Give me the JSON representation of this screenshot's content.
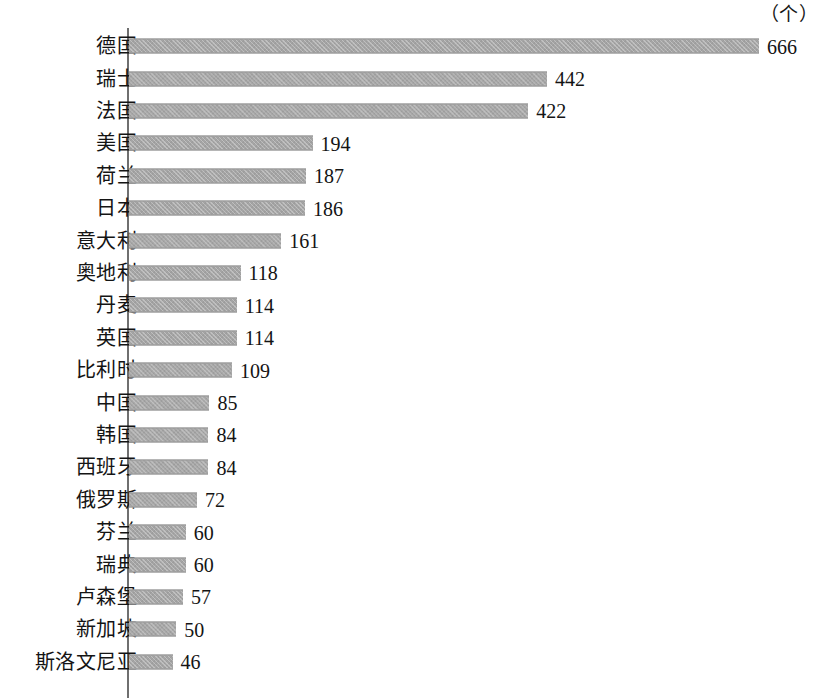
{
  "chart_data": {
    "type": "bar",
    "orientation": "horizontal",
    "title": "",
    "subtitle": "",
    "unit_label": "（个）",
    "xlabel": "",
    "ylabel": "",
    "grid": false,
    "legend": null,
    "axis_line": "vertical-left",
    "xlim": [
      0,
      666
    ],
    "categories": [
      "德国",
      "瑞士",
      "法国",
      "美国",
      "荷兰",
      "日本",
      "意大利",
      "奥地利",
      "丹麦",
      "英国",
      "比利时",
      "中国",
      "韩国",
      "西班牙",
      "俄罗斯",
      "芬兰",
      "瑞典",
      "卢森堡",
      "新加坡",
      "斯洛文尼亚"
    ],
    "values": [
      666,
      442,
      422,
      194,
      187,
      186,
      161,
      118,
      114,
      114,
      109,
      85,
      84,
      84,
      72,
      60,
      60,
      57,
      50,
      46
    ],
    "value_labels": [
      "666",
      "442",
      "422",
      "194",
      "187",
      "186",
      "161",
      "118",
      "114",
      "114",
      "109",
      "85",
      "84",
      "84",
      "72",
      "60",
      "60",
      "57",
      "50",
      "46"
    ],
    "bar_color": "#a5a5a5",
    "axis_color": "#6f6f6f",
    "text_color": "#141414",
    "background": "#ffffff",
    "rows": [
      {
        "category": "德国",
        "value": 666,
        "label": "666"
      },
      {
        "category": "瑞士",
        "value": 442,
        "label": "442"
      },
      {
        "category": "法国",
        "value": 422,
        "label": "422"
      },
      {
        "category": "美国",
        "value": 194,
        "label": "194"
      },
      {
        "category": "荷兰",
        "value": 187,
        "label": "187"
      },
      {
        "category": "日本",
        "value": 186,
        "label": "186"
      },
      {
        "category": "意大利",
        "value": 161,
        "label": "161"
      },
      {
        "category": "奥地利",
        "value": 118,
        "label": "118"
      },
      {
        "category": "丹麦",
        "value": 114,
        "label": "114"
      },
      {
        "category": "英国",
        "value": 114,
        "label": "114"
      },
      {
        "category": "比利时",
        "value": 109,
        "label": "109"
      },
      {
        "category": "中国",
        "value": 85,
        "label": "85"
      },
      {
        "category": "韩国",
        "value": 84,
        "label": "84"
      },
      {
        "category": "西班牙",
        "value": 84,
        "label": "84"
      },
      {
        "category": "俄罗斯",
        "value": 72,
        "label": "72"
      },
      {
        "category": "芬兰",
        "value": 60,
        "label": "60"
      },
      {
        "category": "瑞典",
        "value": 60,
        "label": "60"
      },
      {
        "category": "卢森堡",
        "value": 57,
        "label": "57"
      },
      {
        "category": "新加坡",
        "value": 50,
        "label": "50"
      },
      {
        "category": "斯洛文尼亚",
        "value": 46,
        "label": "46"
      }
    ]
  }
}
